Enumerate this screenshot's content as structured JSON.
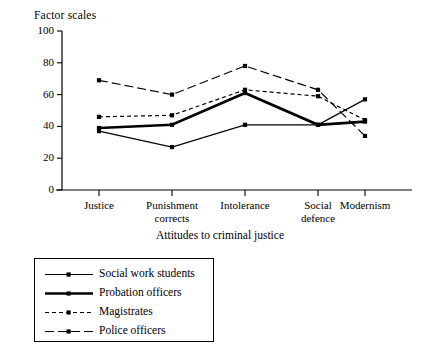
{
  "chart_data": {
    "type": "line",
    "title": "",
    "ylabel": "Factor scales",
    "xlabel": "Attitudes to criminal justice",
    "categories": [
      "Justice",
      "Punishment corrects",
      "Intolerance",
      "Social defence",
      "Modernism"
    ],
    "category_lines": [
      [
        "Justice"
      ],
      [
        "Punishment",
        "corrects"
      ],
      [
        "Intolerance"
      ],
      [
        "Social",
        "defence"
      ],
      [
        "Modernism"
      ]
    ],
    "ylim": [
      0,
      100
    ],
    "yticks": [
      0,
      20,
      40,
      60,
      80,
      100
    ],
    "grid": false,
    "legend_position": "below-left",
    "series": [
      {
        "name": "Social work students",
        "style": "solid-thin",
        "marker": "filled-square",
        "values": [
          37,
          27,
          41,
          41,
          57
        ]
      },
      {
        "name": "Probation officers",
        "style": "solid-thick",
        "marker": "filled-square",
        "values": [
          39,
          41,
          61,
          41,
          43
        ]
      },
      {
        "name": "Magistrates",
        "style": "short-dashed",
        "marker": "filled-square",
        "values": [
          46,
          47,
          63,
          59,
          44
        ]
      },
      {
        "name": "Police officers",
        "style": "long-dashed",
        "marker": "filled-square",
        "values": [
          69,
          60,
          78,
          63,
          34
        ]
      }
    ]
  },
  "axis": {
    "ytick_labels": [
      "100",
      "80",
      "60",
      "40",
      "20",
      "0"
    ],
    "ylabel_text": "Factor scales",
    "xlabel_text": "Attitudes to criminal justice"
  },
  "legend": {
    "items": [
      {
        "label": "Social work students"
      },
      {
        "label": "Probation officers"
      },
      {
        "label": "Magistrates"
      },
      {
        "label": "Police officers"
      }
    ]
  },
  "colors": {
    "ink": "#000000",
    "background": "#ffffff"
  }
}
